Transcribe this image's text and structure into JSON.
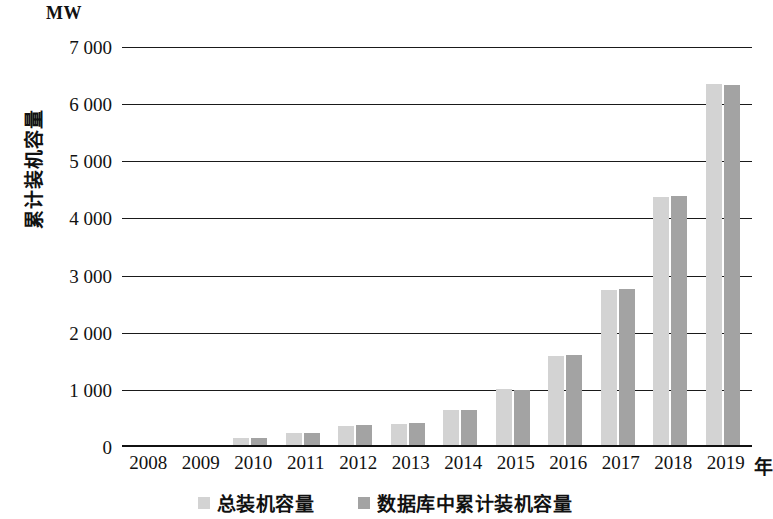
{
  "chart_data": {
    "type": "bar",
    "title": "",
    "subtitle": "",
    "unit_label": "MW",
    "xlabel": "年",
    "ylabel": "累计装机容量",
    "ylim": [
      0,
      7000
    ],
    "ytick_labels": [
      "0",
      "1 000",
      "2 000",
      "3 000",
      "4 000",
      "5 000",
      "6 000",
      "7 000"
    ],
    "ytick_values": [
      0,
      1000,
      2000,
      3000,
      4000,
      5000,
      6000,
      7000
    ],
    "grid": true,
    "legend_position": "bottom",
    "categories": [
      "2008",
      "2009",
      "2010",
      "2011",
      "2012",
      "2013",
      "2014",
      "2015",
      "2016",
      "2017",
      "2018",
      "2019"
    ],
    "series": [
      {
        "name": "总装机容量",
        "color": "#d3d3d3",
        "values": [
          0,
          0,
          150,
          250,
          370,
          400,
          640,
          1010,
          1600,
          2740,
          4380,
          6350
        ]
      },
      {
        "name": "数据库中累计装机容量",
        "color": "#a3a3a3",
        "values": [
          0,
          0,
          150,
          250,
          390,
          420,
          650,
          990,
          1610,
          2760,
          4400,
          6330
        ]
      }
    ]
  },
  "colors": {
    "series_light": "#d3d3d3",
    "series_dark": "#a3a3a3",
    "axis": "#111111",
    "grid": "#1a1a1a",
    "background": "#ffffff"
  }
}
